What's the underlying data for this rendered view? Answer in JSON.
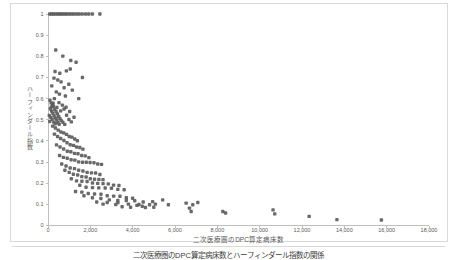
{
  "figure": {
    "caption": "二次医療圏のDPC算定病床数とハーフィンダール指数の関係"
  },
  "chart_data": {
    "type": "scatter",
    "title": "",
    "xlabel": "二次医療圏のDPC算定病床数",
    "ylabel": "ハーフィンダール指数",
    "xlim": [
      0,
      18000
    ],
    "ylim": [
      0,
      1
    ],
    "x_ticks": [
      0,
      2000,
      4000,
      6000,
      8000,
      10000,
      12000,
      14000,
      16000,
      18000
    ],
    "y_ticks": [
      0,
      0.1,
      0.2,
      0.3,
      0.4,
      0.5,
      0.6,
      0.7,
      0.8,
      0.9,
      1
    ],
    "grid": false,
    "legend": null,
    "marker_color": "#5c5c5c",
    "axis_color": "#bfbfbf",
    "tick_label_color": "#595959",
    "points": [
      [
        80,
        1
      ],
      [
        165,
        1
      ],
      [
        255,
        1
      ],
      [
        340,
        1
      ],
      [
        445,
        1
      ],
      [
        525,
        1
      ],
      [
        615,
        1
      ],
      [
        705,
        1
      ],
      [
        805,
        1
      ],
      [
        895,
        1
      ],
      [
        1005,
        1
      ],
      [
        1115,
        1
      ],
      [
        1225,
        1
      ],
      [
        1355,
        1
      ],
      [
        1475,
        1
      ],
      [
        1615,
        1
      ],
      [
        1775,
        1
      ],
      [
        1925,
        1
      ],
      [
        2095,
        1
      ],
      [
        2450,
        1
      ],
      [
        365,
        0.83
      ],
      [
        700,
        0.801
      ],
      [
        1076,
        0.78
      ],
      [
        1327,
        0.772
      ],
      [
        1052,
        0.74
      ],
      [
        868,
        0.731
      ],
      [
        332,
        0.728
      ],
      [
        558,
        0.72
      ],
      [
        1626,
        0.7
      ],
      [
        282,
        0.697
      ],
      [
        463,
        0.688
      ],
      [
        618,
        0.679
      ],
      [
        983,
        0.668
      ],
      [
        178,
        0.66
      ],
      [
        762,
        0.651
      ],
      [
        1148,
        0.64
      ],
      [
        392,
        0.632
      ],
      [
        538,
        0.621
      ],
      [
        822,
        0.612
      ],
      [
        1452,
        0.6
      ],
      [
        92,
        0.592
      ],
      [
        148,
        0.58
      ],
      [
        212,
        0.571
      ],
      [
        263,
        0.563
      ],
      [
        112,
        0.552
      ],
      [
        318,
        0.549
      ],
      [
        172,
        0.541
      ],
      [
        383,
        0.538
      ],
      [
        228,
        0.531
      ],
      [
        443,
        0.528
      ],
      [
        62,
        0.52
      ],
      [
        288,
        0.519
      ],
      [
        502,
        0.516
      ],
      [
        132,
        0.511
      ],
      [
        352,
        0.508
      ],
      [
        563,
        0.506
      ],
      [
        198,
        0.502
      ],
      [
        412,
        0.499
      ],
      [
        618,
        0.497
      ],
      [
        82,
        0.492
      ],
      [
        272,
        0.489
      ],
      [
        468,
        0.487
      ],
      [
        703,
        0.488
      ],
      [
        342,
        0.481
      ],
      [
        528,
        0.479
      ],
      [
        792,
        0.478
      ],
      [
        158,
        0.561
      ],
      [
        242,
        0.578
      ],
      [
        422,
        0.558
      ],
      [
        598,
        0.542
      ],
      [
        878,
        0.521
      ],
      [
        988,
        0.501
      ],
      [
        758,
        0.551
      ],
      [
        1102,
        0.49
      ],
      [
        1228,
        0.512
      ],
      [
        302,
        0.6
      ],
      [
        518,
        0.581
      ],
      [
        678,
        0.569
      ],
      [
        852,
        0.559
      ],
      [
        1022,
        0.539
      ],
      [
        222,
        0.47
      ],
      [
        348,
        0.461
      ],
      [
        482,
        0.451
      ],
      [
        608,
        0.442
      ],
      [
        742,
        0.438
      ],
      [
        872,
        0.431
      ],
      [
        1002,
        0.421
      ],
      [
        1128,
        0.418
      ],
      [
        1262,
        0.409
      ],
      [
        1388,
        0.401
      ],
      [
        302,
        0.432
      ],
      [
        452,
        0.421
      ],
      [
        598,
        0.411
      ],
      [
        752,
        0.402
      ],
      [
        898,
        0.391
      ],
      [
        1048,
        0.382
      ],
      [
        1202,
        0.379
      ],
      [
        1348,
        0.371
      ],
      [
        1502,
        0.369
      ],
      [
        1648,
        0.361
      ],
      [
        402,
        0.381
      ],
      [
        568,
        0.371
      ],
      [
        738,
        0.362
      ],
      [
        912,
        0.351
      ],
      [
        1078,
        0.349
      ],
      [
        1252,
        0.341
      ],
      [
        1418,
        0.339
      ],
      [
        1592,
        0.331
      ],
      [
        1758,
        0.329
      ],
      [
        1932,
        0.321
      ],
      [
        548,
        0.331
      ],
      [
        728,
        0.322
      ],
      [
        908,
        0.318
      ],
      [
        1092,
        0.311
      ],
      [
        1268,
        0.309
      ],
      [
        1448,
        0.301
      ],
      [
        1632,
        0.299
      ],
      [
        1808,
        0.299
      ],
      [
        1988,
        0.298
      ],
      [
        2172,
        0.297
      ],
      [
        2348,
        0.291
      ],
      [
        2528,
        0.289
      ],
      [
        648,
        0.291
      ],
      [
        852,
        0.281
      ],
      [
        1048,
        0.272
      ],
      [
        1252,
        0.269
      ],
      [
        1448,
        0.261
      ],
      [
        1652,
        0.258
      ],
      [
        1848,
        0.251
      ],
      [
        2052,
        0.249
      ],
      [
        2248,
        0.248
      ],
      [
        2452,
        0.241
      ],
      [
        798,
        0.261
      ],
      [
        1002,
        0.251
      ],
      [
        1198,
        0.242
      ],
      [
        1402,
        0.239
      ],
      [
        1598,
        0.231
      ],
      [
        1802,
        0.229
      ],
      [
        1998,
        0.221
      ],
      [
        2198,
        0.219
      ],
      [
        2402,
        0.218
      ],
      [
        2598,
        0.217
      ],
      [
        1102,
        0.221
      ],
      [
        1348,
        0.211
      ],
      [
        1602,
        0.209
      ],
      [
        1848,
        0.208
      ],
      [
        2102,
        0.201
      ],
      [
        2348,
        0.199
      ],
      [
        2602,
        0.198
      ],
      [
        2848,
        0.197
      ],
      [
        3098,
        0.191
      ],
      [
        3352,
        0.189
      ],
      [
        1502,
        0.19
      ],
      [
        1798,
        0.181
      ],
      [
        2102,
        0.179
      ],
      [
        2398,
        0.178
      ],
      [
        2702,
        0.177
      ],
      [
        2998,
        0.176
      ],
      [
        3298,
        0.171
      ],
      [
        3598,
        0.169
      ],
      [
        1302,
        0.161
      ],
      [
        1598,
        0.158
      ],
      [
        1902,
        0.151
      ],
      [
        2198,
        0.149
      ],
      [
        2502,
        0.148
      ],
      [
        2798,
        0.141
      ],
      [
        3102,
        0.139
      ],
      [
        3398,
        0.138
      ],
      [
        3702,
        0.131
      ],
      [
        3998,
        0.129
      ],
      [
        1698,
        0.141
      ],
      [
        2098,
        0.131
      ],
      [
        2498,
        0.128
      ],
      [
        2898,
        0.121
      ],
      [
        3298,
        0.119
      ],
      [
        3698,
        0.118
      ],
      [
        4098,
        0.117
      ],
      [
        4498,
        0.111
      ],
      [
        2302,
        0.111
      ],
      [
        2798,
        0.109
      ],
      [
        3302,
        0.108
      ],
      [
        3798,
        0.101
      ],
      [
        4298,
        0.099
      ],
      [
        4798,
        0.098
      ],
      [
        2602,
        0.101
      ],
      [
        3202,
        0.099
      ],
      [
        4202,
        0.095
      ],
      [
        4452,
        0.091
      ],
      [
        3902,
        0.086
      ],
      [
        4602,
        0.085
      ],
      [
        3502,
        0.089
      ],
      [
        4998,
        0.086
      ],
      [
        4944,
        0.113
      ],
      [
        5072,
        0.101
      ],
      [
        5418,
        0.121
      ],
      [
        5688,
        0.098
      ],
      [
        6527,
        0.106
      ],
      [
        6683,
        0.082
      ],
      [
        6764,
        0.066
      ],
      [
        6840,
        0.098
      ],
      [
        7077,
        0.109
      ],
      [
        8262,
        0.066
      ],
      [
        8390,
        0.059
      ],
      [
        10632,
        0.074
      ],
      [
        10712,
        0.055
      ],
      [
        12338,
        0.043
      ],
      [
        13650,
        0.028
      ],
      [
        15750,
        0.026
      ]
    ]
  }
}
